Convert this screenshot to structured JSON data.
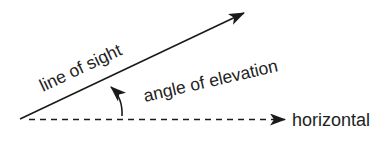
{
  "diagram": {
    "type": "angle-of-elevation",
    "labels": {
      "line_of_sight": "line of sight",
      "angle_of_elevation": "angle of elevation",
      "horizontal": "horizontal"
    },
    "colors": {
      "stroke": "#1a1a1a",
      "text": "#222222",
      "background": "#ffffff"
    },
    "lines": {
      "line_of_sight": {
        "style": "solid",
        "arrow": "end"
      },
      "horizontal": {
        "style": "dashed",
        "arrow": "end"
      },
      "angle_indicator": {
        "style": "curved",
        "arrow": "end"
      }
    }
  }
}
